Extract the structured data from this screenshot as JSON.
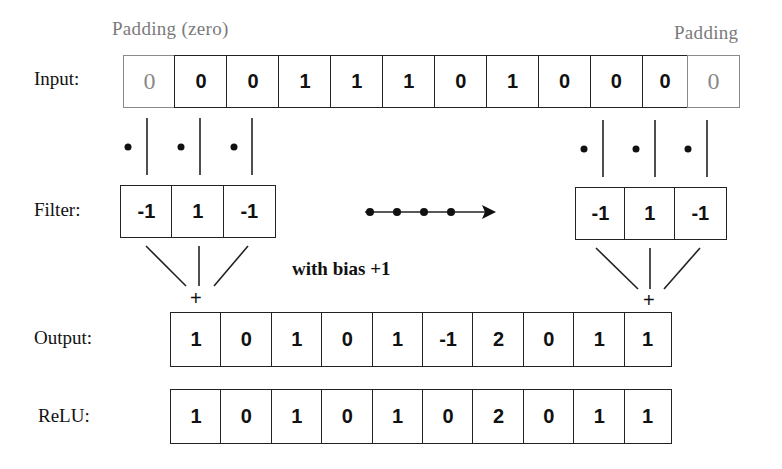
{
  "labels": {
    "padding_left": "Padding (zero)",
    "padding_right": "Padding",
    "input": "Input:",
    "filter": "Filter:",
    "output": "Output:",
    "relu": "ReLU:",
    "bias": "with bias +1",
    "plus": "+"
  },
  "input": {
    "pad_left": "0",
    "values": [
      "0",
      "0",
      "1",
      "1",
      "1",
      "0",
      "1",
      "0",
      "0",
      "0"
    ],
    "pad_right": "0"
  },
  "filter_left": [
    "-1",
    "1",
    "-1"
  ],
  "filter_right": [
    "-1",
    "1",
    "-1"
  ],
  "output": [
    "1",
    "0",
    "1",
    "0",
    "1",
    "-1",
    "2",
    "0",
    "1",
    "1"
  ],
  "relu": [
    "1",
    "0",
    "1",
    "0",
    "1",
    "0",
    "2",
    "0",
    "1",
    "1"
  ],
  "colors": {
    "line": "#222222",
    "padding": "#8a8a8a"
  }
}
